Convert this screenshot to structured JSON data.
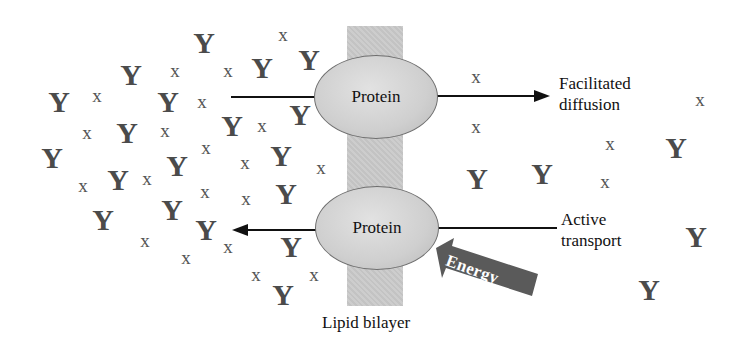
{
  "diagram": {
    "bilayer_label": "Lipid bilayer",
    "proteins": [
      {
        "id": "top",
        "label": "Protein",
        "x": 375,
        "y": 97
      },
      {
        "id": "bottom",
        "label": "Protein",
        "x": 376,
        "y": 228
      }
    ],
    "processes": {
      "facilitated": {
        "line1": "Facilitated",
        "line2": "diffusion",
        "direction": "left-to-right"
      },
      "active": {
        "line1": "Active",
        "line2": "transport",
        "direction": "right-to-left"
      }
    },
    "energy_label": "Energy",
    "colors": {
      "bilayer": "#c9c9c9",
      "protein": "#d0d0d0",
      "energy_arrow": "#5a5a5a",
      "particle": "#4b4b4b",
      "text": "#111111"
    },
    "particles_left": [
      {
        "t": "Y",
        "x": 204,
        "y": 43
      },
      {
        "t": "x",
        "x": 283,
        "y": 34
      },
      {
        "t": "Y",
        "x": 131,
        "y": 75
      },
      {
        "t": "x",
        "x": 175,
        "y": 70
      },
      {
        "t": "x",
        "x": 228,
        "y": 70
      },
      {
        "t": "Y",
        "x": 262,
        "y": 68
      },
      {
        "t": "Y",
        "x": 309,
        "y": 60
      },
      {
        "t": "Y",
        "x": 59,
        "y": 102
      },
      {
        "t": "x",
        "x": 97,
        "y": 95
      },
      {
        "t": "Y",
        "x": 168,
        "y": 102
      },
      {
        "t": "x",
        "x": 202,
        "y": 101
      },
      {
        "t": "x",
        "x": 87,
        "y": 132
      },
      {
        "t": "Y",
        "x": 127,
        "y": 133
      },
      {
        "t": "x",
        "x": 165,
        "y": 130
      },
      {
        "t": "Y",
        "x": 232,
        "y": 126
      },
      {
        "t": "x",
        "x": 262,
        "y": 125
      },
      {
        "t": "Y",
        "x": 300,
        "y": 115
      },
      {
        "t": "Y",
        "x": 52,
        "y": 158
      },
      {
        "t": "x",
        "x": 206,
        "y": 147
      },
      {
        "t": "x",
        "x": 245,
        "y": 162
      },
      {
        "t": "Y",
        "x": 281,
        "y": 156
      },
      {
        "t": "x",
        "x": 83,
        "y": 185
      },
      {
        "t": "Y",
        "x": 118,
        "y": 180
      },
      {
        "t": "x",
        "x": 147,
        "y": 178
      },
      {
        "t": "Y",
        "x": 177,
        "y": 166
      },
      {
        "t": "x",
        "x": 321,
        "y": 167
      },
      {
        "t": "x",
        "x": 205,
        "y": 191
      },
      {
        "t": "x",
        "x": 246,
        "y": 198
      },
      {
        "t": "Y",
        "x": 286,
        "y": 194
      },
      {
        "t": "Y",
        "x": 172,
        "y": 210
      },
      {
        "t": "Y",
        "x": 103,
        "y": 220
      },
      {
        "t": "Y",
        "x": 206,
        "y": 230
      },
      {
        "t": "x",
        "x": 145,
        "y": 240
      },
      {
        "t": "x",
        "x": 186,
        "y": 257
      },
      {
        "t": "x",
        "x": 228,
        "y": 246
      },
      {
        "t": "Y",
        "x": 291,
        "y": 247
      },
      {
        "t": "x",
        "x": 256,
        "y": 274
      },
      {
        "t": "x",
        "x": 314,
        "y": 274
      },
      {
        "t": "Y",
        "x": 283,
        "y": 295
      }
    ],
    "particles_right": [
      {
        "t": "x",
        "x": 476,
        "y": 76
      },
      {
        "t": "x",
        "x": 700,
        "y": 99
      },
      {
        "t": "x",
        "x": 476,
        "y": 126
      },
      {
        "t": "x",
        "x": 610,
        "y": 143
      },
      {
        "t": "Y",
        "x": 676,
        "y": 148
      },
      {
        "t": "Y",
        "x": 477,
        "y": 179
      },
      {
        "t": "Y",
        "x": 542,
        "y": 174
      },
      {
        "t": "x",
        "x": 605,
        "y": 181
      },
      {
        "t": "Y",
        "x": 696,
        "y": 237
      },
      {
        "t": "Y",
        "x": 649,
        "y": 290
      }
    ]
  }
}
